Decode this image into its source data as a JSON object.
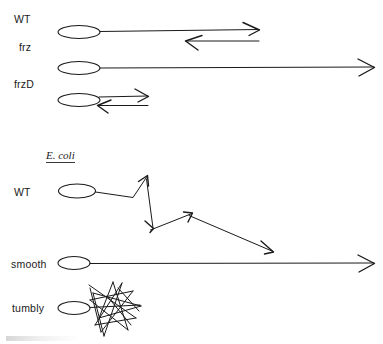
{
  "figure": {
    "width": 383,
    "height": 344,
    "background": "#ffffff",
    "ink_color": "#1a1a1a"
  },
  "sections": {
    "myxococcus": {
      "rows": [
        {
          "label": "WT",
          "pattern": "reversing: long forward run then reverse run"
        },
        {
          "label": "frz",
          "pattern": "non-reversing: single long forward run"
        },
        {
          "label": "frzD",
          "pattern": "hyper-reversing: short forward and reverse runs"
        }
      ]
    },
    "ecoli": {
      "heading": "E. coli",
      "rows": [
        {
          "label": "WT",
          "pattern": "run and tumble: zigzag path with direction changes"
        },
        {
          "label": "smooth",
          "pattern": "smooth swimming: single long straight run"
        },
        {
          "label": "tumbly",
          "pattern": "constant tumbling: tight scribbled cluster"
        }
      ]
    }
  },
  "labels": {
    "wt_top": "WT",
    "frz": "frz",
    "frzd": "frzD",
    "ecoli_heading": "E. coli",
    "wt_ecoli": "WT",
    "smooth": "smooth",
    "tumbly": "tumbly"
  }
}
